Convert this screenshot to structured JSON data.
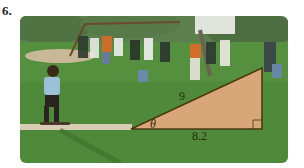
{
  "problem": {
    "number": "6."
  },
  "figure": {
    "triangle": {
      "hypotenuse_label": "9",
      "base_label": "8.2",
      "angle_label": "θ",
      "right_angle_marker": true,
      "fill_color": "#d9a679",
      "stroke_color": "#4a3a12"
    },
    "colors": {
      "grass": "#4f8a3a",
      "trees": "#3f6e34",
      "sky": "#e8ece4",
      "path": "#d8cdb4"
    }
  }
}
